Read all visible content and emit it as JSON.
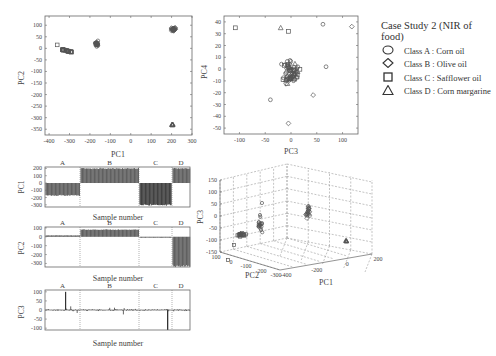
{
  "chart_data": [
    {
      "type": "scatter",
      "id": "pc1_pc2",
      "xlabel": "PC1",
      "ylabel": "PC2",
      "xlim": [
        -420,
        300
      ],
      "ylim": [
        -375,
        140
      ],
      "xticks": [
        -400,
        -300,
        -200,
        -100,
        0,
        100,
        200,
        300
      ],
      "yticks": [
        100,
        50,
        0,
        -50,
        -100,
        -150,
        -200,
        -250,
        -300,
        -350
      ],
      "grid": false,
      "series": [
        {
          "name": "Class A : Corn oil",
          "marker": "circle",
          "cluster_center": [
            -165,
            20
          ],
          "spread": [
            15,
            15
          ]
        },
        {
          "name": "Class B : Olive oil",
          "marker": "diamond",
          "cluster_center": [
            210,
            82
          ],
          "spread": [
            15,
            12
          ]
        },
        {
          "name": "Class C : Safflower oil",
          "marker": "square",
          "cluster_center": [
            -310,
            -15
          ],
          "spread": [
            25,
            6
          ],
          "outlier": [
            -360,
            15
          ]
        },
        {
          "name": "Class D : Corn margarine",
          "marker": "triangle",
          "cluster_center": [
            205,
            -330
          ],
          "spread": [
            6,
            3
          ]
        }
      ]
    },
    {
      "type": "scatter",
      "id": "pc3_pc4",
      "xlabel": "PC3",
      "ylabel": "PC4",
      "xlim": [
        -130,
        130
      ],
      "ylim": [
        -55,
        45
      ],
      "xticks": [
        -100,
        -50,
        0,
        50,
        100
      ],
      "yticks": [
        40,
        30,
        20,
        10,
        0,
        -10,
        -20,
        -30,
        -40,
        -50
      ],
      "grid": false,
      "points_note": "Mixed classes clustered around origin with scattered outliers",
      "notable_points": [
        [
          -108,
          35
        ],
        [
          62,
          38
        ],
        [
          118,
          36
        ],
        [
          68,
          2
        ],
        [
          -5,
          -46
        ],
        [
          -40,
          -26
        ],
        [
          43,
          -22
        ]
      ]
    },
    {
      "type": "bar",
      "id": "pc1_scores",
      "xlabel": "Sample number",
      "ylabel": "PC1",
      "ylim": [
        -330,
        220
      ],
      "yticks": [
        200,
        100,
        0,
        -100,
        -200,
        -300
      ],
      "groups": [
        "A",
        "B",
        "C",
        "D"
      ],
      "group_mean_values": [
        -170,
        200,
        -300,
        200
      ]
    },
    {
      "type": "bar",
      "id": "pc2_scores",
      "xlabel": "Sample number",
      "ylabel": "PC2",
      "ylim": [
        -340,
        110
      ],
      "yticks": [
        100,
        0,
        -100,
        -200,
        -300
      ],
      "groups": [
        "A",
        "B",
        "C",
        "D"
      ],
      "group_mean_values": [
        15,
        80,
        -10,
        -330
      ]
    },
    {
      "type": "bar",
      "id": "pc3_scores",
      "xlabel": "Sample number",
      "ylabel": "PC3",
      "ylim": [
        -110,
        110
      ],
      "yticks": [
        100,
        50,
        0,
        -50,
        -100
      ],
      "groups": [
        "A",
        "B",
        "C",
        "D"
      ],
      "notable_values": {
        "A_max": 100,
        "A_typical": [
          -30,
          55
        ],
        "B_typical": [
          -40,
          30
        ],
        "C_min": -110
      }
    },
    {
      "type": "scatter",
      "id": "pc1_pc2_pc3_3d",
      "xlabel": "PC1",
      "ylabel": "PC2",
      "zlabel": "PC3",
      "xticks": [
        -400,
        -200,
        0,
        200
      ],
      "yticks": [
        100,
        0,
        -100,
        -200,
        -300
      ],
      "zticks": [
        150,
        100,
        50,
        0,
        -50,
        -100,
        -150
      ],
      "grid": true
    }
  ],
  "legend": {
    "title": "Case Study 2 (NIR of food)",
    "items": [
      {
        "symbol": "circle",
        "label": "Class A : Corn oil"
      },
      {
        "symbol": "diamond",
        "label": "Class B : Olive oil"
      },
      {
        "symbol": "square",
        "label": "Class C : Safflower oil"
      },
      {
        "symbol": "triangle",
        "label": "Class D : Corn margarine"
      }
    ]
  },
  "labels": {
    "pc1": "PC1",
    "pc2": "PC2",
    "pc3": "PC3",
    "pc4": "PC4",
    "sample_number": "Sample number",
    "groupA": "A",
    "groupB": "B",
    "groupC": "C",
    "groupD": "D"
  },
  "colors": {
    "bar": "#555555",
    "bar_dark": "#333333",
    "axis": "#666666",
    "marker": "#555555",
    "grid": "#888888"
  }
}
